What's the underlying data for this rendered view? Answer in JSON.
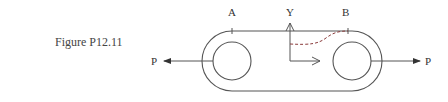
{
  "figure": {
    "caption": "Figure P12.11",
    "labels": {
      "point_a": "A",
      "point_b": "B",
      "axis_y": "Y",
      "load_left": "P",
      "load_right": "P"
    },
    "elements": [
      "link-outline (obround plate)",
      "left-hole",
      "right-hole",
      "tick-a",
      "tick-b",
      "y-axis-arrow",
      "x-axis-arrow",
      "dashed-section-curve",
      "left-force-arrow",
      "right-force-arrow"
    ],
    "colors": {
      "line": "#555555",
      "dashed_curve": "#8a3b3b",
      "text": "#333333"
    }
  }
}
